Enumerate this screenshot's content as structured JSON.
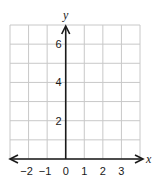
{
  "chart_data": {
    "type": "scatter",
    "title": "",
    "xlabel": "x",
    "ylabel": "y",
    "xlim": [
      -3,
      4
    ],
    "ylim": [
      0,
      7
    ],
    "x_ticks": [
      -2,
      -1,
      0,
      1,
      2,
      3
    ],
    "x_tick_labels": [
      "−2",
      "−1",
      "0",
      "1",
      "2",
      "3"
    ],
    "y_ticks": [
      2,
      4,
      6
    ],
    "y_tick_labels": [
      "2",
      "4",
      "6"
    ],
    "grid": true,
    "grid_step": 1,
    "x_axis_arrows": "both",
    "y_axis_arrows": "up",
    "points": [],
    "legend": null
  },
  "colors": {
    "grid": "#c8c8c8",
    "axis": "#1a1a1a",
    "background": "#ffffff"
  }
}
